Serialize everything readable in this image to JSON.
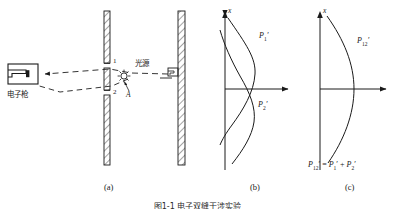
{
  "figure": {
    "caption": "图1-1  电子双缝干涉实验",
    "panels": [
      {
        "id": "a",
        "label": "(a)"
      },
      {
        "id": "b",
        "label": "(b)"
      },
      {
        "id": "c",
        "label": "(c)"
      }
    ]
  },
  "panel_a": {
    "electron_gun_label": "电子枪",
    "light_source_label": "光源",
    "slit_1_label": "1",
    "slit_2_label": "2",
    "point_a_label": "A",
    "barrier_name": "double-slit-barrier",
    "screen_name": "detector-screen"
  },
  "panel_b": {
    "axis_label": "x",
    "curve_1_label": "P",
    "curve_1_sub": "1",
    "curve_1_prime": "′",
    "curve_2_label": "P",
    "curve_2_sub": "2",
    "curve_2_prime": "′"
  },
  "panel_c": {
    "axis_label": "x",
    "curve_label": "P",
    "curve_sub": "12",
    "curve_prime": "′",
    "equation_p": "P",
    "equation_sub12": "12",
    "equation_eq": "=",
    "equation_sub1": "1",
    "equation_plus": "+",
    "equation_sub2": "2",
    "equation_prime": "′"
  },
  "colors": {
    "stroke": "#1a1a1a",
    "background": "#ffffff",
    "dash": "#333333"
  }
}
